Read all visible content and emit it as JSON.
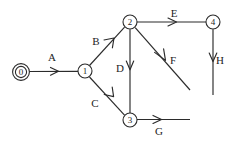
{
  "diagram": {
    "canvas": {
      "width": 239,
      "height": 145,
      "background": "#ffffff"
    },
    "stroke_color": "#2b2b2b",
    "text_color": "#1d1d1d",
    "nodes": [
      {
        "id": "n0",
        "label": "0",
        "cx": 21,
        "cy": 72,
        "r": 6.2,
        "double_circle": true
      },
      {
        "id": "n1",
        "label": "1",
        "cx": 85,
        "cy": 71,
        "r": 7.0,
        "double_circle": false
      },
      {
        "id": "n2",
        "label": "2",
        "cx": 130,
        "cy": 22,
        "r": 7.0,
        "double_circle": false
      },
      {
        "id": "n3",
        "label": "3",
        "cx": 130,
        "cy": 120,
        "r": 7.0,
        "double_circle": false
      },
      {
        "id": "n4",
        "label": "4",
        "cx": 213,
        "cy": 22,
        "r": 7.0,
        "double_circle": false
      }
    ],
    "edges": [
      {
        "id": "eA",
        "label": "A",
        "from": "n0",
        "to": "n1",
        "label_x": 52,
        "label_y": 57
      },
      {
        "id": "eB",
        "label": "B",
        "from": "n1",
        "to": "n2",
        "label_x": 96,
        "label_y": 41
      },
      {
        "id": "eC",
        "label": "C",
        "from": "n1",
        "to": "n3",
        "label_x": 95,
        "label_y": 103
      },
      {
        "id": "eD",
        "label": "D",
        "from": "n2",
        "to": "n3",
        "label_x": 120,
        "label_y": 68
      },
      {
        "id": "eE",
        "label": "E",
        "from": "n2",
        "to": "n4",
        "label_x": 174,
        "label_y": 13
      },
      {
        "id": "eF",
        "label": "F",
        "from": "n2",
        "to": "open",
        "label_x": 173,
        "label_y": 60
      },
      {
        "id": "eG",
        "label": "G",
        "from": "n3",
        "to": "open",
        "label_x": 159,
        "label_y": 131
      },
      {
        "id": "eH",
        "label": "H",
        "from": "n4",
        "to": "open",
        "label_x": 220,
        "label_y": 60
      }
    ]
  }
}
